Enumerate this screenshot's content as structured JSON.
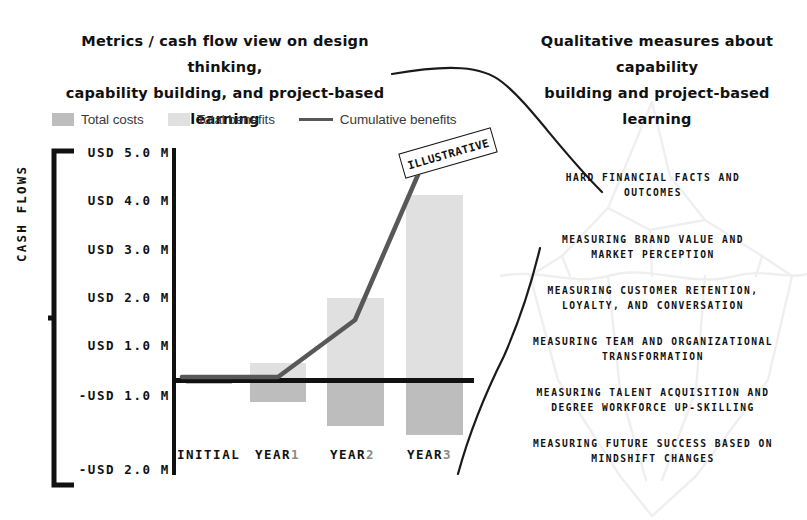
{
  "headings": {
    "left_line1": "Metrics / cash flow view on design thinking,",
    "left_line2": "capability building, and project-based learning",
    "right_line1": "Qualitative measures about capability",
    "right_line2": "building and project-based learning"
  },
  "stamp": {
    "label": "ILLUSTRATIVE"
  },
  "legend": {
    "items": [
      {
        "label": "Total costs",
        "marker": "swatch",
        "color": "#bdbdbd"
      },
      {
        "label": "Total benefits",
        "marker": "swatch",
        "color": "#e0e0e0"
      },
      {
        "label": "Cumulative benefits",
        "marker": "line",
        "color": "#585858"
      }
    ]
  },
  "axis": {
    "y_title": "CASH FLOWS",
    "y_ticks": [
      "USD 5.0 M",
      "USD 4.0 M",
      "USD 3.0 M",
      "USD 2.0 M",
      "USD 1.0 M",
      "-USD 1.0 M",
      "-USD 2.0 M"
    ],
    "x_ticks": [
      {
        "name": "INITIAL",
        "suffix": ""
      },
      {
        "name": "YEAR",
        "suffix": "1"
      },
      {
        "name": "YEAR",
        "suffix": "2"
      },
      {
        "name": "YEAR",
        "suffix": "3"
      }
    ]
  },
  "iceberg": {
    "items": [
      "HARD FINANCIAL FACTS AND\nOUTCOMES",
      "MEASURING BRAND VALUE AND\nMARKET PERCEPTION",
      "MEASURING CUSTOMER RETENTION,\nLOYALTY, AND CONVERSATION",
      "MEASURING TEAM AND ORGANIZATIONAL\nTRANSFORMATION",
      "MEASURING TALENT ACQUISITION AND\nDEGREE WORKFORCE UP-SKILLING",
      "MEASURING FUTURE SUCCESS BASED ON\nMINDSHIFT CHANGES"
    ]
  },
  "colors": {
    "total_costs": "#bdbdbd",
    "total_benefits": "#e0e0e0",
    "cumulative_line": "#585858",
    "axis": "#111111",
    "iceberg_outline": "#efefef"
  },
  "chart_data": {
    "type": "bar",
    "title": "Metrics / cash flow view on design thinking, capability building, and project-based learning",
    "xlabel": "",
    "ylabel": "CASH FLOWS",
    "ylim": [
      -2.0,
      5.0
    ],
    "ytick_values": [
      5.0,
      4.0,
      3.0,
      2.0,
      1.0,
      -1.0,
      -2.0
    ],
    "categories": [
      "INITIAL",
      "YEAR 1",
      "YEAR 2",
      "YEAR 3"
    ],
    "grid": false,
    "legend_position": "top-left",
    "series": [
      {
        "name": "Total benefits",
        "type": "bar",
        "color": "#e0e0e0",
        "values": [
          0.0,
          0.35,
          1.7,
          3.85
        ]
      },
      {
        "name": "Total costs",
        "type": "bar",
        "color": "#bdbdbd",
        "values": [
          -0.05,
          -0.45,
          -0.95,
          -1.15
        ]
      },
      {
        "name": "Cumulative benefits",
        "type": "line",
        "color": "#585858",
        "values": [
          0.0,
          0.0,
          1.25,
          4.4
        ]
      }
    ],
    "annotations": [
      "ILLUSTRATIVE"
    ]
  }
}
